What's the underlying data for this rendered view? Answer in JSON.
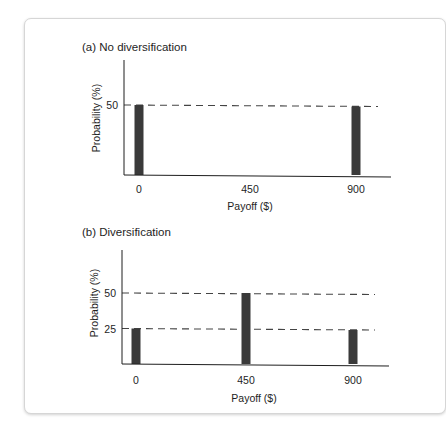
{
  "chart_data": [
    {
      "type": "bar",
      "title": "(a) No diversification",
      "xlabel": "Payoff ($)",
      "ylabel": "Probability (%)",
      "categories": [
        "0",
        "450",
        "900"
      ],
      "x": [
        0,
        450,
        900
      ],
      "values": [
        50,
        0,
        50
      ],
      "yticks": [
        50
      ],
      "reference_lines": [
        50
      ],
      "ylim": [
        0,
        80
      ],
      "grid": false,
      "legend": "none"
    },
    {
      "type": "bar",
      "title": "(b) Diversification",
      "xlabel": "Payoff ($)",
      "ylabel": "Probability (%)",
      "categories": [
        "0",
        "450",
        "900"
      ],
      "x": [
        0,
        450,
        900
      ],
      "values": [
        25,
        50,
        25
      ],
      "yticks": [
        50,
        25
      ],
      "reference_lines": [
        50,
        25
      ],
      "ylim": [
        0,
        80
      ],
      "grid": false,
      "legend": "none"
    }
  ],
  "colors": {
    "bar": "#3a3a3a",
    "axis": "#1e1e1e",
    "dash": "#444444"
  }
}
